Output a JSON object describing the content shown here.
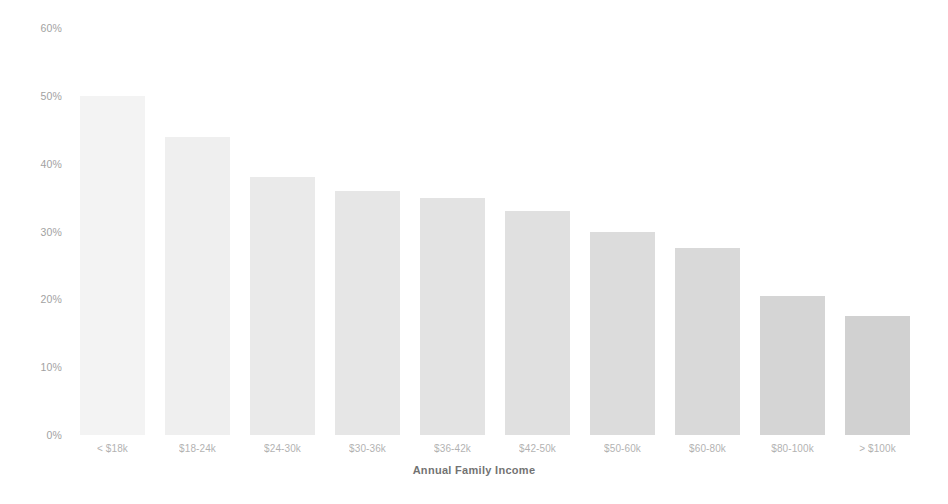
{
  "chart_data": {
    "type": "bar",
    "title": "",
    "subtitle": "",
    "xlabel": "Annual Family Income",
    "ylabel": "",
    "categories": [
      "< $18k",
      "$18-24k",
      "$24-30k",
      "$30-36k",
      "$36-42k",
      "$42-50k",
      "$50-60k",
      "$60-80k",
      "$80-100k",
      "> $100k"
    ],
    "values": [
      50,
      44,
      38,
      36,
      35,
      33,
      30,
      27.5,
      20.5,
      17.5
    ],
    "value_suffix": "%",
    "ylim": [
      0,
      60
    ],
    "ytick_values": [
      60,
      50,
      40,
      30,
      20,
      10,
      0
    ],
    "ytick_labels": [
      "60%",
      "50%",
      "40%",
      "30%",
      "20%",
      "10%",
      "0%"
    ],
    "grid": false,
    "legend": null,
    "legend_position": "none",
    "bar_colors": [
      "#f1f1f1",
      "#ececec",
      "#e6e6e6",
      "#e2e2e2",
      "#dedede",
      "#dadada",
      "#d6d6d6",
      "#d2d2d2",
      "#cdcdcd",
      "#c9c9c9"
    ],
    "background_color": "#ffffff",
    "axis_text_color": "#4a4a4a"
  }
}
